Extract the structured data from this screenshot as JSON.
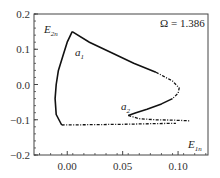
{
  "chart_data": {
    "type": "line",
    "title": "",
    "xlabel": "",
    "ylabel": "",
    "xlim": [
      -0.03,
      0.127
    ],
    "ylim": [
      -0.2,
      0.2
    ],
    "xticks": [
      0.0,
      0.05,
      0.1
    ],
    "xtick_labels": [
      "0.00",
      "0.05",
      "0.10"
    ],
    "yticks": [
      0.2,
      0.1,
      0.0,
      -0.1,
      -0.2
    ],
    "ytick_labels": [
      "0.2",
      "0.1",
      "0.0",
      "−0.1",
      "−0.2"
    ],
    "grid": false,
    "legend": null,
    "annotations": {
      "omega": "Ω = 1.386",
      "e2n": {
        "base": "E",
        "sub": "2n"
      },
      "e1n": {
        "base": "E",
        "sub": "1n"
      },
      "a1": {
        "base": "a",
        "sub": "1"
      },
      "a2": {
        "base": "a",
        "sub": "2"
      }
    },
    "series": [
      {
        "name": "solid-branch",
        "style": "solid",
        "x": [
          -0.005,
          -0.01,
          -0.011,
          -0.01,
          -0.008,
          -0.004,
          0.0,
          0.0045
        ],
        "y": [
          -0.115,
          -0.085,
          -0.04,
          0.0,
          0.04,
          0.08,
          0.12,
          0.15
        ]
      },
      {
        "name": "upper-branch",
        "style": "solid-to-dashed",
        "x": [
          0.0045,
          0.02,
          0.04,
          0.06,
          0.08,
          0.095,
          0.101,
          0.1,
          0.095
        ],
        "y": [
          0.15,
          0.12,
          0.09,
          0.06,
          0.035,
          0.01,
          -0.01,
          -0.025,
          -0.04
        ]
      },
      {
        "name": "to-a2",
        "style": "solid",
        "x": [
          0.095,
          0.085,
          0.072,
          0.062,
          0.055
        ],
        "y": [
          -0.04,
          -0.055,
          -0.07,
          -0.08,
          -0.088
        ]
      },
      {
        "name": "a2-lower-tail",
        "style": "dashed",
        "x": [
          0.055,
          0.065,
          0.08,
          0.095,
          0.11
        ],
        "y": [
          -0.088,
          -0.097,
          -0.1,
          -0.101,
          -0.103
        ]
      },
      {
        "name": "bottom-branch",
        "style": "dashed",
        "x": [
          -0.005,
          0.02,
          0.05,
          0.08,
          0.098
        ],
        "y": [
          -0.115,
          -0.114,
          -0.113,
          -0.111,
          -0.11
        ]
      }
    ]
  }
}
